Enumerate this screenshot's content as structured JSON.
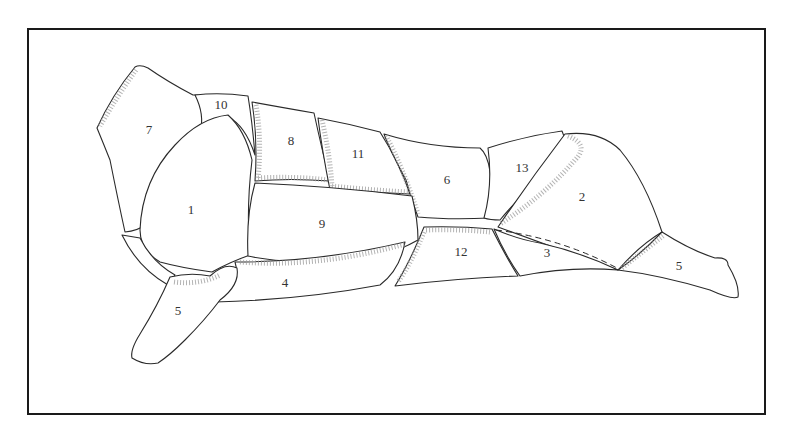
{
  "figure": {
    "frame_color": "#1a1a1a",
    "line_color": "#2a2a2a",
    "stipple_color": "#9a9a9a",
    "regions": [
      {
        "id": "1",
        "label": "1",
        "x": 191,
        "y": 210
      },
      {
        "id": "2",
        "label": "2",
        "x": 582,
        "y": 197
      },
      {
        "id": "3",
        "label": "3",
        "x": 547,
        "y": 253
      },
      {
        "id": "4",
        "label": "4",
        "x": 285,
        "y": 283
      },
      {
        "id": "5-front",
        "label": "5",
        "x": 178,
        "y": 311
      },
      {
        "id": "5-rear",
        "label": "5",
        "x": 679,
        "y": 266
      },
      {
        "id": "6",
        "label": "6",
        "x": 447,
        "y": 180
      },
      {
        "id": "7",
        "label": "7",
        "x": 149,
        "y": 130
      },
      {
        "id": "8",
        "label": "8",
        "x": 291,
        "y": 141
      },
      {
        "id": "9",
        "label": "9",
        "x": 322,
        "y": 224
      },
      {
        "id": "10",
        "label": "10",
        "x": 221,
        "y": 105
      },
      {
        "id": "11",
        "label": "11",
        "x": 358,
        "y": 154
      },
      {
        "id": "12",
        "label": "12",
        "x": 461,
        "y": 252
      },
      {
        "id": "13",
        "label": "13",
        "x": 522,
        "y": 168
      }
    ]
  }
}
